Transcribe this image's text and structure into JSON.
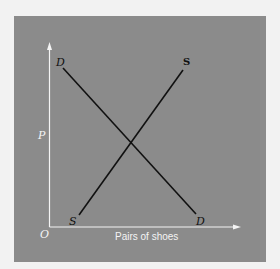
{
  "diagram": {
    "type": "supply-demand",
    "axis_y_label": "P",
    "axis_x_label": "Pairs of shoes",
    "origin_label": "O",
    "demand_curve": {
      "label_top": "D",
      "label_bottom": "D",
      "start": [
        63,
        68
      ],
      "end": [
        196,
        214
      ]
    },
    "supply_curve": {
      "label_top": "S",
      "label_bottom": "S",
      "start": [
        79,
        215
      ],
      "end": [
        183,
        70
      ]
    },
    "colors": {
      "panel": "#8b8b8b",
      "background": "#f2f2f2",
      "axes": "#f4f4f4",
      "curves": "#111111",
      "axis_label_text": "#f4f4f4",
      "curve_label_text": "#111111"
    }
  }
}
